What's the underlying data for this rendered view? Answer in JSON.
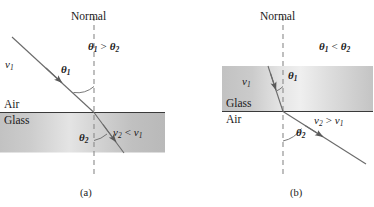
{
  "figure": {
    "type": "physics-refraction-diagram",
    "colors": {
      "ink": "#1a1a1a",
      "ray": "#555555",
      "normal_dash": "#777777",
      "glass_light": "#f2f2f2",
      "glass_mid": "#cfcfcf",
      "glass_dark": "#b8b8b8"
    }
  },
  "panel_a": {
    "caption": "(a)",
    "normal_label": "Normal",
    "medium_upper": "Air",
    "medium_lower": "Glass",
    "incident_speed": "v",
    "incident_speed_sub": "1",
    "angle_incidence": "θ",
    "angle_incidence_sub": "1",
    "angle_refraction": "θ",
    "angle_refraction_sub": "2",
    "angle_relation": "θ₁ > θ₂",
    "speed_relation": "v₂ < v₁",
    "angle_relation_parts": {
      "theta": "θ",
      "sub1": "1",
      "operator": ">",
      "sub2": "2"
    },
    "speed_relation_parts": {
      "v": "v",
      "sub2": "2",
      "operator": "<",
      "sub1": "1"
    }
  },
  "panel_b": {
    "caption": "(b)",
    "normal_label": "Normal",
    "medium_upper": "Glass",
    "medium_lower": "Air",
    "incident_speed": "v",
    "incident_speed_sub": "1",
    "angle_incidence": "θ",
    "angle_incidence_sub": "1",
    "angle_refraction": "θ",
    "angle_refraction_sub": "2",
    "angle_relation": "θ₁ < θ₂",
    "speed_relation": "v₂ > v₁",
    "angle_relation_parts": {
      "theta": "θ",
      "sub1": "1",
      "operator": "<",
      "sub2": "2"
    },
    "speed_relation_parts": {
      "v": "v",
      "sub2": "2",
      "operator": ">",
      "sub1": "1"
    }
  }
}
